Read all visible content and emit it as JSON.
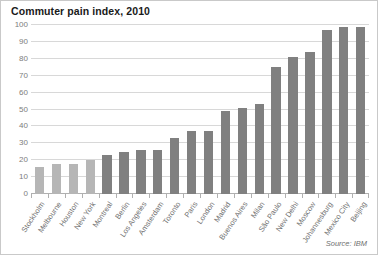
{
  "chart_data": {
    "type": "bar",
    "title": "Commuter pain index, 2010",
    "xlabel": "",
    "ylabel": "",
    "ylim": [
      0,
      100
    ],
    "yticks": [
      0,
      10,
      20,
      30,
      40,
      50,
      60,
      70,
      80,
      90,
      100
    ],
    "grid": true,
    "legend": false,
    "source": "Source: IBM",
    "categories": [
      "Stockholm",
      "Melbourne",
      "Houston",
      "New York",
      "Montreal",
      "Berlin",
      "Los Angeles",
      "Amsterdam",
      "Toronto",
      "Paris",
      "London",
      "Madrid",
      "Buenos Aires",
      "Milan",
      "São Paulo",
      "New Delhi",
      "Moscow",
      "Johannesburg",
      "Mexico City",
      "Beijing"
    ],
    "values": [
      16,
      18,
      18,
      20,
      23,
      25,
      26,
      26,
      33,
      37,
      37,
      49,
      51,
      53,
      75,
      81,
      84,
      97,
      99,
      99
    ],
    "bar_colors": [
      "#b6b6b6",
      "#b6b6b6",
      "#b6b6b6",
      "#b6b6b6",
      "#808080",
      "#808080",
      "#808080",
      "#808080",
      "#808080",
      "#808080",
      "#808080",
      "#808080",
      "#808080",
      "#808080",
      "#808080",
      "#808080",
      "#808080",
      "#808080",
      "#808080",
      "#808080"
    ],
    "colors": {
      "bar_light": "#b6b6b6",
      "bar_dark": "#808080",
      "grid": "#d8d8d8",
      "axis_text": "#7d7d7d",
      "title_text": "#1a1a1a",
      "border": "#c9c9c9",
      "background": "#ffffff"
    }
  }
}
